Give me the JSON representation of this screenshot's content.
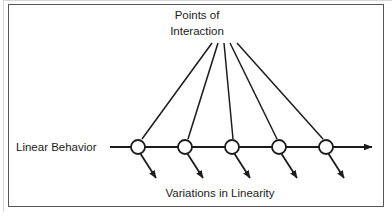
{
  "figure": {
    "type": "annotated-line-diagram",
    "title_line_1": "Points of",
    "title_line_2": "Interaction",
    "axis_label": "Linear Behavior",
    "bottom_label": "Variations in Linearity",
    "colors": {
      "stroke": "#1c1c1c",
      "frame": "#565656",
      "outer_edge": "#d8d8d8",
      "background": "#ffffff",
      "node_fill": "#ffffff"
    },
    "node_count": 5,
    "main_axis": {
      "start_x": 110,
      "end_x": 374,
      "y": 147,
      "arrow": "right"
    },
    "nodes": [
      {
        "id": "node-1",
        "cx": 138,
        "cy": 147,
        "r": 7
      },
      {
        "id": "node-2",
        "cx": 185,
        "cy": 147,
        "r": 7
      },
      {
        "id": "node-3",
        "cx": 232,
        "cy": 147,
        "r": 7
      },
      {
        "id": "node-4",
        "cx": 279,
        "cy": 147,
        "r": 7
      },
      {
        "id": "node-5",
        "cx": 326,
        "cy": 147,
        "r": 7
      }
    ],
    "leader_lines": [
      {
        "id": "leader-1",
        "x1": 212,
        "y1": 43,
        "x2": 142,
        "y2": 139
      },
      {
        "id": "leader-2",
        "x1": 218,
        "y1": 43,
        "x2": 188,
        "y2": 139
      },
      {
        "id": "leader-3",
        "x1": 224,
        "y1": 43,
        "x2": 233,
        "y2": 139
      },
      {
        "id": "leader-4",
        "x1": 230,
        "y1": 43,
        "x2": 277,
        "y2": 139
      },
      {
        "id": "leader-5",
        "x1": 237,
        "y1": 43,
        "x2": 323,
        "y2": 139
      }
    ],
    "variation_arrows": [
      {
        "id": "variation-arrow-1",
        "x1": 140,
        "y1": 153,
        "x2": 158,
        "y2": 181
      },
      {
        "id": "variation-arrow-2",
        "x1": 187,
        "y1": 153,
        "x2": 205,
        "y2": 181
      },
      {
        "id": "variation-arrow-3",
        "x1": 234,
        "y1": 153,
        "x2": 252,
        "y2": 181
      },
      {
        "id": "variation-arrow-4",
        "x1": 281,
        "y1": 153,
        "x2": 299,
        "y2": 181
      },
      {
        "id": "variation-arrow-5",
        "x1": 328,
        "y1": 153,
        "x2": 346,
        "y2": 181
      }
    ]
  }
}
